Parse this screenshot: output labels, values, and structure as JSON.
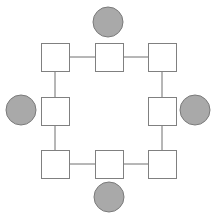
{
  "diagram": {
    "width": 216,
    "height": 214,
    "colors": {
      "background": "#ffffff",
      "square_fill": "#ffffff",
      "square_stroke": "#808080",
      "circle_fill": "#a9a9a9",
      "circle_stroke": "#7a7a7a",
      "edge_stroke": "#6e6e6e"
    },
    "squares": [
      {
        "id": "top-left",
        "x": 41,
        "y": 43,
        "size": 28
      },
      {
        "id": "top-middle",
        "x": 95,
        "y": 43,
        "size": 28
      },
      {
        "id": "top-right",
        "x": 148,
        "y": 43,
        "size": 28
      },
      {
        "id": "middle-left",
        "x": 41,
        "y": 97,
        "size": 28
      },
      {
        "id": "middle-right",
        "x": 148,
        "y": 97,
        "size": 28
      },
      {
        "id": "bottom-left",
        "x": 41,
        "y": 150,
        "size": 28
      },
      {
        "id": "bottom-middle",
        "x": 95,
        "y": 150,
        "size": 28
      },
      {
        "id": "bottom-right",
        "x": 148,
        "y": 150,
        "size": 28
      }
    ],
    "circles": [
      {
        "id": "top",
        "cx": 108,
        "cy": 22,
        "r": 15
      },
      {
        "id": "left",
        "cx": 21,
        "cy": 110,
        "r": 15
      },
      {
        "id": "right",
        "cx": 195,
        "cy": 110,
        "r": 15
      },
      {
        "id": "bottom",
        "cx": 109,
        "cy": 197,
        "r": 15
      }
    ],
    "edges": [
      {
        "from": "top-left",
        "to": "top-middle"
      },
      {
        "from": "top-middle",
        "to": "top-right"
      },
      {
        "from": "top-left",
        "to": "middle-left"
      },
      {
        "from": "top-right",
        "to": "middle-right"
      },
      {
        "from": "middle-left",
        "to": "bottom-left"
      },
      {
        "from": "middle-right",
        "to": "bottom-right"
      },
      {
        "from": "bottom-left",
        "to": "bottom-middle"
      },
      {
        "from": "bottom-middle",
        "to": "bottom-right"
      }
    ]
  }
}
